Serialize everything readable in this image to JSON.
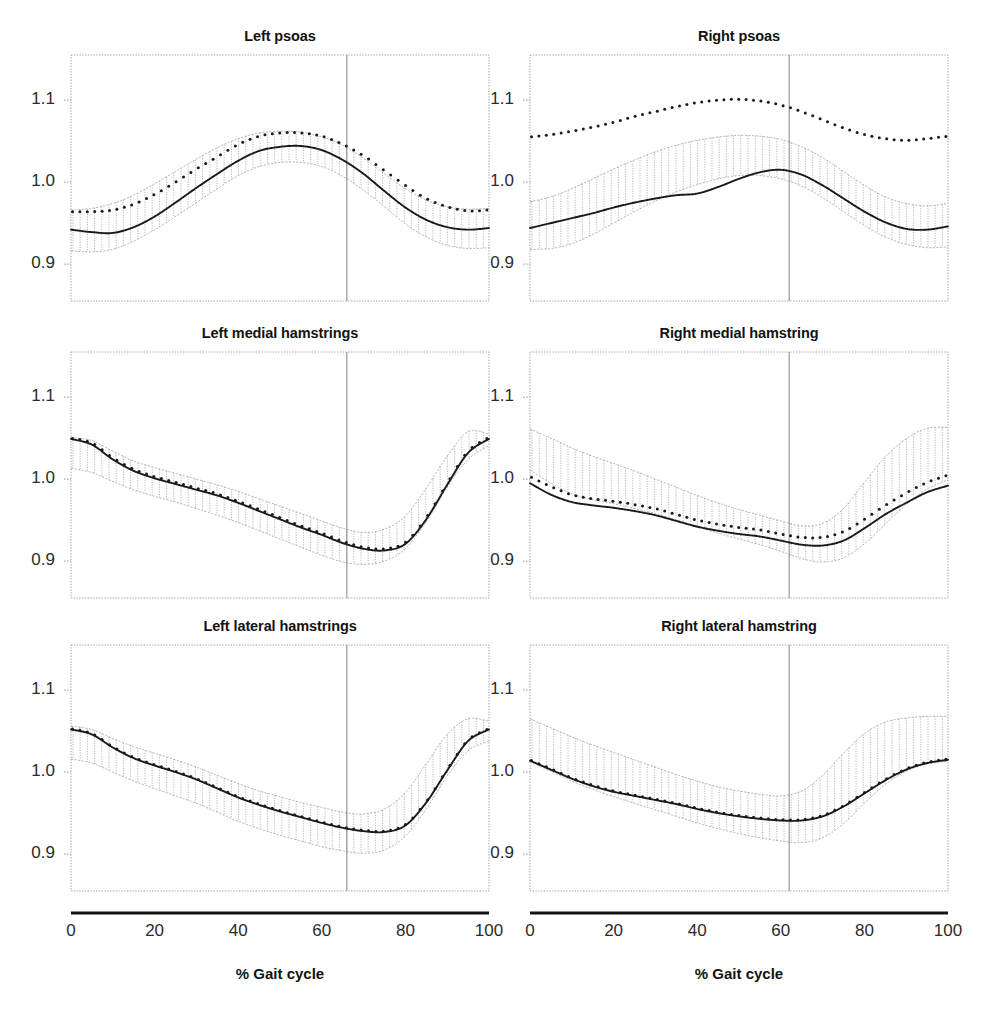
{
  "figure": {
    "background_color": "#ffffff",
    "line_color": "#1a1a1a",
    "band_color": "#9a9a9a",
    "axis_color": "#8f8f8f",
    "xaxis_title": "% Gait cycle",
    "xticks": [
      0,
      20,
      40,
      60,
      80,
      100
    ],
    "yticks": [
      1.1,
      1.0,
      0.9
    ],
    "ytick_labels": [
      "1.1",
      "1.0",
      "0.9"
    ],
    "xtick_labels": [
      "0",
      "20",
      "40",
      "60",
      "80",
      "100"
    ]
  },
  "chart_data": [
    {
      "type": "line",
      "title": "Left psoas",
      "xlabel": "% Gait cycle",
      "ylabel": "",
      "xlim": [
        0,
        100
      ],
      "ylim": [
        0.855,
        1.155
      ],
      "grid": false,
      "toe_off": 66,
      "x": [
        0,
        5,
        10,
        15,
        20,
        25,
        30,
        35,
        40,
        45,
        50,
        55,
        60,
        65,
        70,
        75,
        80,
        85,
        90,
        95,
        100
      ],
      "series": [
        {
          "name": "patient",
          "style": "solid",
          "values": [
            0.942,
            0.939,
            0.938,
            0.945,
            0.958,
            0.975,
            0.993,
            1.01,
            1.026,
            1.038,
            1.043,
            1.044,
            1.039,
            1.027,
            1.01,
            0.989,
            0.969,
            0.954,
            0.945,
            0.942,
            0.944
          ]
        },
        {
          "name": "normal-mean",
          "style": "dotted",
          "values": [
            0.964,
            0.964,
            0.966,
            0.973,
            0.985,
            1.0,
            1.016,
            1.031,
            1.046,
            1.056,
            1.06,
            1.06,
            1.056,
            1.046,
            1.032,
            1.014,
            0.996,
            0.98,
            0.97,
            0.965,
            0.966
          ]
        },
        {
          "name": "band-upper",
          "style": "envelope",
          "values": [
            0.966,
            0.968,
            0.974,
            0.984,
            0.998,
            1.013,
            1.028,
            1.042,
            1.053,
            1.06,
            1.062,
            1.061,
            1.055,
            1.045,
            1.029,
            1.01,
            0.992,
            0.978,
            0.97,
            0.967,
            0.968
          ]
        },
        {
          "name": "band-lower",
          "style": "envelope",
          "values": [
            0.916,
            0.915,
            0.918,
            0.928,
            0.942,
            0.958,
            0.975,
            0.992,
            1.008,
            1.019,
            1.024,
            1.024,
            1.019,
            1.007,
            0.99,
            0.97,
            0.949,
            0.933,
            0.923,
            0.919,
            0.92
          ]
        }
      ]
    },
    {
      "type": "line",
      "title": "Right psoas",
      "xlabel": "% Gait cycle",
      "ylabel": "",
      "xlim": [
        0,
        100
      ],
      "ylim": [
        0.855,
        1.155
      ],
      "grid": false,
      "toe_off": 62,
      "x": [
        0,
        5,
        10,
        15,
        20,
        25,
        30,
        35,
        40,
        45,
        50,
        55,
        60,
        65,
        70,
        75,
        80,
        85,
        90,
        95,
        100
      ],
      "series": [
        {
          "name": "patient",
          "style": "solid",
          "values": [
            0.944,
            0.95,
            0.956,
            0.962,
            0.969,
            0.975,
            0.98,
            0.984,
            0.986,
            0.994,
            1.004,
            1.012,
            1.015,
            1.009,
            0.996,
            0.98,
            0.964,
            0.951,
            0.943,
            0.942,
            0.946
          ]
        },
        {
          "name": "normal-mean",
          "style": "dotted",
          "values": [
            1.055,
            1.058,
            1.062,
            1.067,
            1.073,
            1.08,
            1.086,
            1.092,
            1.097,
            1.1,
            1.101,
            1.099,
            1.094,
            1.086,
            1.076,
            1.066,
            1.058,
            1.053,
            1.051,
            1.053,
            1.056
          ]
        },
        {
          "name": "band-upper",
          "style": "envelope",
          "values": [
            0.976,
            0.982,
            0.992,
            1.004,
            1.016,
            1.027,
            1.037,
            1.045,
            1.051,
            1.055,
            1.057,
            1.056,
            1.052,
            1.043,
            1.03,
            1.013,
            0.996,
            0.982,
            0.974,
            0.971,
            0.974
          ]
        },
        {
          "name": "band-lower",
          "style": "envelope",
          "values": [
            0.918,
            0.919,
            0.925,
            0.936,
            0.95,
            0.964,
            0.977,
            0.988,
            0.997,
            1.004,
            1.008,
            1.008,
            1.004,
            0.995,
            0.981,
            0.964,
            0.947,
            0.933,
            0.924,
            0.92,
            0.921
          ]
        }
      ]
    },
    {
      "type": "line",
      "title": "Left medial hamstrings",
      "xlabel": "% Gait cycle",
      "ylabel": "",
      "xlim": [
        0,
        100
      ],
      "ylim": [
        0.855,
        1.155
      ],
      "grid": false,
      "toe_off": 66,
      "x": [
        0,
        5,
        10,
        15,
        20,
        25,
        30,
        35,
        40,
        45,
        50,
        55,
        60,
        65,
        70,
        75,
        80,
        85,
        90,
        95,
        100
      ],
      "series": [
        {
          "name": "patient",
          "style": "solid",
          "values": [
            1.049,
            1.042,
            1.024,
            1.01,
            1.001,
            0.994,
            0.987,
            0.98,
            0.971,
            0.961,
            0.951,
            0.941,
            0.932,
            0.922,
            0.915,
            0.913,
            0.921,
            0.951,
            0.993,
            1.032,
            1.049
          ]
        },
        {
          "name": "normal-mean",
          "style": "dotted",
          "values": [
            1.05,
            1.044,
            1.026,
            1.012,
            1.003,
            0.996,
            0.989,
            0.982,
            0.973,
            0.963,
            0.953,
            0.943,
            0.934,
            0.924,
            0.917,
            0.915,
            0.923,
            0.953,
            0.995,
            1.034,
            1.051
          ]
        },
        {
          "name": "band-upper",
          "style": "envelope",
          "values": [
            1.051,
            1.047,
            1.034,
            1.022,
            1.014,
            1.007,
            1.0,
            0.993,
            0.985,
            0.976,
            0.967,
            0.958,
            0.949,
            0.94,
            0.935,
            0.939,
            0.955,
            0.989,
            1.028,
            1.058,
            1.055
          ]
        },
        {
          "name": "band-lower",
          "style": "envelope",
          "values": [
            1.013,
            1.008,
            0.997,
            0.987,
            0.979,
            0.972,
            0.964,
            0.956,
            0.947,
            0.937,
            0.927,
            0.917,
            0.907,
            0.899,
            0.896,
            0.9,
            0.915,
            0.948,
            0.99,
            1.024,
            1.041
          ]
        }
      ]
    },
    {
      "type": "line",
      "title": "Right medial hamstring",
      "xlabel": "% Gait cycle",
      "ylabel": "",
      "xlim": [
        0,
        100
      ],
      "ylim": [
        0.855,
        1.155
      ],
      "grid": false,
      "toe_off": 62,
      "x": [
        0,
        5,
        10,
        15,
        20,
        25,
        30,
        35,
        40,
        45,
        50,
        55,
        60,
        65,
        70,
        75,
        80,
        85,
        90,
        95,
        100
      ],
      "series": [
        {
          "name": "patient",
          "style": "solid",
          "values": [
            0.995,
            0.981,
            0.972,
            0.968,
            0.965,
            0.961,
            0.956,
            0.949,
            0.942,
            0.937,
            0.933,
            0.93,
            0.925,
            0.92,
            0.919,
            0.925,
            0.94,
            0.957,
            0.971,
            0.984,
            0.992
          ]
        },
        {
          "name": "normal-mean",
          "style": "dotted",
          "values": [
            1.003,
            0.991,
            0.981,
            0.976,
            0.973,
            0.969,
            0.964,
            0.957,
            0.95,
            0.945,
            0.941,
            0.938,
            0.933,
            0.929,
            0.929,
            0.936,
            0.951,
            0.968,
            0.983,
            0.996,
            1.005
          ]
        },
        {
          "name": "band-upper",
          "style": "envelope",
          "values": [
            1.061,
            1.05,
            1.038,
            1.028,
            1.019,
            1.01,
            1.0,
            0.99,
            0.98,
            0.971,
            0.963,
            0.956,
            0.949,
            0.943,
            0.946,
            0.964,
            0.996,
            1.027,
            1.049,
            1.062,
            1.063
          ]
        },
        {
          "name": "band-lower",
          "style": "envelope",
          "values": [
            1.011,
            0.995,
            0.982,
            0.975,
            0.97,
            0.964,
            0.958,
            0.95,
            0.942,
            0.934,
            0.927,
            0.92,
            0.912,
            0.903,
            0.899,
            0.904,
            0.921,
            0.945,
            0.969,
            0.988,
            0.999
          ]
        }
      ]
    },
    {
      "type": "line",
      "title": "Left lateral hamstrings",
      "xlabel": "% Gait cycle",
      "ylabel": "",
      "xlim": [
        0,
        100
      ],
      "ylim": [
        0.855,
        1.155
      ],
      "grid": false,
      "toe_off": 66,
      "x": [
        0,
        5,
        10,
        15,
        20,
        25,
        30,
        35,
        40,
        45,
        50,
        55,
        60,
        65,
        70,
        75,
        80,
        85,
        90,
        95,
        100
      ],
      "series": [
        {
          "name": "patient",
          "style": "solid",
          "values": [
            1.052,
            1.046,
            1.03,
            1.017,
            1.008,
            1.0,
            0.991,
            0.98,
            0.969,
            0.96,
            0.952,
            0.945,
            0.938,
            0.932,
            0.928,
            0.927,
            0.935,
            0.963,
            1.002,
            1.038,
            1.052
          ]
        },
        {
          "name": "normal-mean",
          "style": "dotted",
          "values": [
            1.053,
            1.047,
            1.031,
            1.018,
            1.009,
            1.001,
            0.992,
            0.981,
            0.97,
            0.961,
            0.953,
            0.946,
            0.939,
            0.933,
            0.929,
            0.928,
            0.936,
            0.964,
            1.003,
            1.039,
            1.053
          ]
        },
        {
          "name": "band-upper",
          "style": "envelope",
          "values": [
            1.056,
            1.052,
            1.041,
            1.031,
            1.023,
            1.015,
            1.006,
            0.996,
            0.986,
            0.977,
            0.97,
            0.963,
            0.957,
            0.951,
            0.949,
            0.955,
            0.975,
            1.01,
            1.046,
            1.065,
            1.062
          ]
        },
        {
          "name": "band-lower",
          "style": "envelope",
          "values": [
            1.016,
            1.011,
            1.0,
            0.989,
            0.98,
            0.971,
            0.962,
            0.951,
            0.94,
            0.931,
            0.923,
            0.916,
            0.909,
            0.904,
            0.901,
            0.905,
            0.922,
            0.955,
            0.995,
            1.026,
            1.038
          ]
        }
      ]
    },
    {
      "type": "line",
      "title": "Right lateral hamstring",
      "xlabel": "% Gait cycle",
      "ylabel": "",
      "xlim": [
        0,
        100
      ],
      "ylim": [
        0.855,
        1.155
      ],
      "grid": false,
      "toe_off": 62,
      "x": [
        0,
        5,
        10,
        15,
        20,
        25,
        30,
        35,
        40,
        45,
        50,
        55,
        60,
        65,
        70,
        75,
        80,
        85,
        90,
        95,
        100
      ],
      "series": [
        {
          "name": "patient",
          "style": "solid",
          "values": [
            1.014,
            1.003,
            0.992,
            0.983,
            0.976,
            0.971,
            0.966,
            0.961,
            0.955,
            0.95,
            0.946,
            0.943,
            0.941,
            0.941,
            0.946,
            0.958,
            0.974,
            0.99,
            1.003,
            1.011,
            1.015
          ]
        },
        {
          "name": "normal-mean",
          "style": "dotted",
          "values": [
            1.015,
            1.004,
            0.993,
            0.984,
            0.977,
            0.972,
            0.967,
            0.962,
            0.956,
            0.951,
            0.947,
            0.944,
            0.942,
            0.942,
            0.947,
            0.959,
            0.975,
            0.991,
            1.004,
            1.012,
            1.016
          ]
        },
        {
          "name": "band-upper",
          "style": "envelope",
          "values": [
            1.065,
            1.054,
            1.043,
            1.033,
            1.024,
            1.015,
            1.006,
            0.997,
            0.989,
            0.982,
            0.977,
            0.973,
            0.971,
            0.977,
            0.996,
            1.023,
            1.047,
            1.061,
            1.066,
            1.068,
            1.068
          ]
        },
        {
          "name": "band-lower",
          "style": "envelope",
          "values": [
            1.013,
            1.001,
            0.989,
            0.979,
            0.97,
            0.962,
            0.954,
            0.946,
            0.938,
            0.931,
            0.925,
            0.92,
            0.916,
            0.914,
            0.92,
            0.937,
            0.962,
            0.985,
            1.001,
            1.01,
            1.013
          ]
        }
      ]
    }
  ]
}
